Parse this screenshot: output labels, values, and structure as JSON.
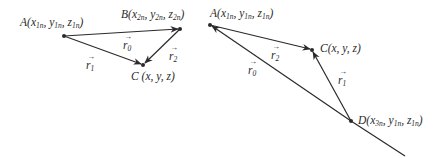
{
  "diagram_left": {
    "points": {
      "A": {
        "name": "A",
        "coords": [
          "x",
          "1n",
          "y",
          "1n",
          "z",
          "1n"
        ],
        "label": "A(x1n, y1n, z1n)"
      },
      "B": {
        "name": "B",
        "coords": [
          "x",
          "2n",
          "y",
          "2n",
          "z",
          "2n"
        ],
        "label": "B(x2n, y2n, z2n)"
      },
      "C": {
        "name": "C",
        "label": "C (x, y, z)"
      }
    },
    "vectors": [
      {
        "name": "r",
        "sub": "0",
        "from": "A",
        "to": "B"
      },
      {
        "name": "r",
        "sub": "1",
        "from": "A",
        "to": "C"
      },
      {
        "name": "r",
        "sub": "2",
        "from": "B",
        "to": "C"
      }
    ]
  },
  "diagram_right": {
    "points": {
      "A": {
        "name": "A",
        "label": "A(x1n, y1n, z1n)"
      },
      "C": {
        "name": "C",
        "label": "C(x, y, z)"
      },
      "D": {
        "name": "D",
        "label": "D(x3n, y1n, z1n)"
      }
    },
    "vectors": [
      {
        "name": "r",
        "sub": "0",
        "from": "D",
        "to": "A"
      },
      {
        "name": "r",
        "sub": "1",
        "from": "D",
        "to": "C"
      },
      {
        "name": "r",
        "sub": "2",
        "from": "A",
        "to": "C"
      }
    ]
  },
  "labels": {
    "left_A": {
      "letter": "A",
      "open": "(",
      "x": "x",
      "xs": "1n",
      "y": "y",
      "ys": "1n",
      "z": "z",
      "zs": "1n",
      "close": ")",
      "sep": ", "
    },
    "left_B": {
      "letter": "B",
      "open": "(",
      "x": "x",
      "xs": "2n",
      "y": "y",
      "ys": "2n",
      "z": "z",
      "zs": "2n",
      "close": ")",
      "sep": ", "
    },
    "left_C": {
      "text": "C (x, y, z)"
    },
    "right_A": {
      "letter": "A",
      "open": "(",
      "x": "x",
      "xs": "1n",
      "y": "y",
      "ys": "1n",
      "z": "z",
      "zs": "1n",
      "close": ")",
      "sep": ", "
    },
    "right_C": {
      "text": "C(x, y, z)"
    },
    "right_D": {
      "letter": "D",
      "open": "(",
      "x": "x",
      "xs": "3n",
      "y": "y",
      "ys": "1n",
      "z": "z",
      "zs": "1n",
      "close": ")",
      "sep": ", "
    },
    "vec_r": "r",
    "vec_arrow": "→",
    "sub0": "0",
    "sub1": "1",
    "sub2": "2"
  },
  "colors": {
    "stroke": "#2a2a2a",
    "background": "#ffffff"
  }
}
